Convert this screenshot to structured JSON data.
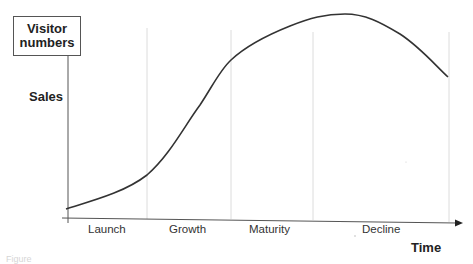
{
  "diagram": {
    "y_axis": {
      "box_label_line1": "Visitor",
      "box_label_line2": "numbers",
      "label": "Sales"
    },
    "x_axis": {
      "label": "Time"
    },
    "stages": [
      {
        "label": "Launch"
      },
      {
        "label": "Growth"
      },
      {
        "label": "Maturity"
      },
      {
        "label": "Decline"
      }
    ],
    "caption": "Figure",
    "colors": {
      "curve": "#333333",
      "axis": "#444444",
      "divider": "#dddddd",
      "text": "#222222"
    }
  }
}
